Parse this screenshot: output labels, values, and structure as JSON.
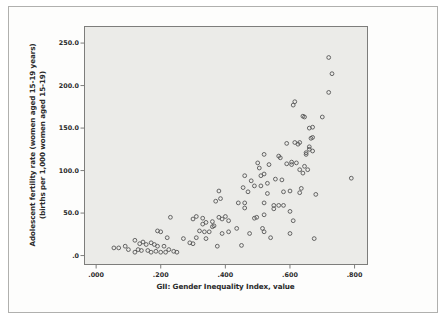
{
  "chart_data": {
    "type": "scatter",
    "title": "",
    "xlabel": "GII: Gender Inequality Index, value",
    "ylabel_line1": "Adolescent fertility rate (women aged 15-19 years)",
    "ylabel_line2": "(births per 1,000 women aged 15-19)",
    "xlim": [
      -0.036,
      0.84
    ],
    "ylim": [
      -10.5,
      269.5
    ],
    "x_ticks": {
      "values": [
        0.0,
        0.2,
        0.4,
        0.6,
        0.8
      ],
      "labels": [
        ".000",
        ".200",
        ".400",
        ".600",
        ".800"
      ]
    },
    "y_ticks": {
      "values": [
        0,
        50,
        100,
        150,
        200,
        250
      ],
      "labels": [
        ".0",
        "50.0",
        "100.0",
        "150.0",
        "200.0",
        "250.0"
      ]
    },
    "grid": false,
    "legend": "none",
    "marker": "open-circle",
    "points": [
      [
        0.055,
        9
      ],
      [
        0.07,
        9
      ],
      [
        0.09,
        11
      ],
      [
        0.1,
        7
      ],
      [
        0.12,
        4
      ],
      [
        0.12,
        18
      ],
      [
        0.13,
        7
      ],
      [
        0.135,
        14
      ],
      [
        0.14,
        6
      ],
      [
        0.145,
        16
      ],
      [
        0.155,
        13
      ],
      [
        0.16,
        6
      ],
      [
        0.17,
        4
      ],
      [
        0.17,
        15
      ],
      [
        0.18,
        13
      ],
      [
        0.185,
        5
      ],
      [
        0.19,
        29
      ],
      [
        0.19,
        11
      ],
      [
        0.2,
        4
      ],
      [
        0.2,
        28
      ],
      [
        0.21,
        11
      ],
      [
        0.215,
        4
      ],
      [
        0.22,
        21
      ],
      [
        0.225,
        7
      ],
      [
        0.23,
        45
      ],
      [
        0.24,
        5
      ],
      [
        0.25,
        4
      ],
      [
        0.27,
        20
      ],
      [
        0.29,
        15
      ],
      [
        0.3,
        14
      ],
      [
        0.3,
        43
      ],
      [
        0.31,
        46
      ],
      [
        0.31,
        21
      ],
      [
        0.32,
        29
      ],
      [
        0.33,
        44
      ],
      [
        0.33,
        37
      ],
      [
        0.335,
        28
      ],
      [
        0.34,
        39
      ],
      [
        0.34,
        20
      ],
      [
        0.35,
        28
      ],
      [
        0.36,
        40
      ],
      [
        0.36,
        34
      ],
      [
        0.365,
        35
      ],
      [
        0.37,
        64
      ],
      [
        0.375,
        11
      ],
      [
        0.38,
        76
      ],
      [
        0.38,
        45
      ],
      [
        0.385,
        67
      ],
      [
        0.39,
        43
      ],
      [
        0.39,
        26
      ],
      [
        0.4,
        46
      ],
      [
        0.41,
        41
      ],
      [
        0.41,
        28
      ],
      [
        0.435,
        32
      ],
      [
        0.44,
        62
      ],
      [
        0.45,
        12
      ],
      [
        0.455,
        80
      ],
      [
        0.46,
        62
      ],
      [
        0.46,
        56
      ],
      [
        0.46,
        94
      ],
      [
        0.47,
        75
      ],
      [
        0.475,
        26
      ],
      [
        0.48,
        88
      ],
      [
        0.49,
        82
      ],
      [
        0.49,
        44
      ],
      [
        0.497,
        45
      ],
      [
        0.5,
        109
      ],
      [
        0.505,
        103
      ],
      [
        0.51,
        82
      ],
      [
        0.51,
        94
      ],
      [
        0.515,
        32
      ],
      [
        0.52,
        119
      ],
      [
        0.52,
        96
      ],
      [
        0.52,
        62
      ],
      [
        0.52,
        48
      ],
      [
        0.52,
        28
      ],
      [
        0.53,
        73
      ],
      [
        0.53,
        85
      ],
      [
        0.535,
        107
      ],
      [
        0.54,
        21
      ],
      [
        0.55,
        59
      ],
      [
        0.55,
        55
      ],
      [
        0.555,
        90
      ],
      [
        0.565,
        59
      ],
      [
        0.565,
        117
      ],
      [
        0.57,
        115
      ],
      [
        0.575,
        89
      ],
      [
        0.58,
        59
      ],
      [
        0.58,
        75
      ],
      [
        0.59,
        132
      ],
      [
        0.59,
        108
      ],
      [
        0.6,
        76
      ],
      [
        0.6,
        26
      ],
      [
        0.605,
        107
      ],
      [
        0.6,
        52
      ],
      [
        0.605,
        110
      ],
      [
        0.61,
        177
      ],
      [
        0.615,
        181
      ],
      [
        0.61,
        41
      ],
      [
        0.615,
        133
      ],
      [
        0.62,
        109
      ],
      [
        0.625,
        131
      ],
      [
        0.63,
        133
      ],
      [
        0.63,
        101
      ],
      [
        0.63,
        74
      ],
      [
        0.635,
        79
      ],
      [
        0.64,
        164
      ],
      [
        0.645,
        163
      ],
      [
        0.64,
        97
      ],
      [
        0.645,
        105
      ],
      [
        0.65,
        121
      ],
      [
        0.65,
        119
      ],
      [
        0.655,
        101
      ],
      [
        0.66,
        150
      ],
      [
        0.66,
        128
      ],
      [
        0.66,
        125
      ],
      [
        0.665,
        138
      ],
      [
        0.67,
        139
      ],
      [
        0.67,
        151
      ],
      [
        0.67,
        123
      ],
      [
        0.68,
        72
      ],
      [
        0.675,
        20
      ],
      [
        0.7,
        163
      ],
      [
        0.72,
        233
      ],
      [
        0.72,
        192
      ],
      [
        0.73,
        214
      ],
      [
        0.79,
        91
      ]
    ]
  },
  "colors": {
    "page_bg": "#ffffff",
    "figure_bg": "#fdfdfc",
    "figure_border": "#b0b0ae",
    "plot_bg": "#ebebe8",
    "plot_frame": "#7d7d7b",
    "tick_mark": "#7d7d7b",
    "marker_stroke": "#565656",
    "text": "#2b2b2b"
  }
}
